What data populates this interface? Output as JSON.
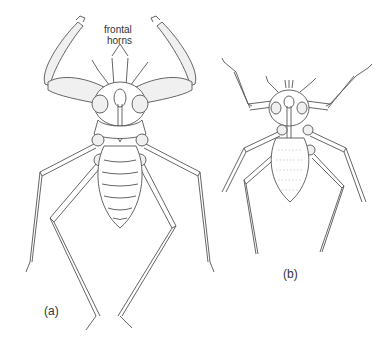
{
  "figure": {
    "annotations": {
      "frontal_horns_line1": "frontal",
      "frontal_horns_line2": "horns"
    },
    "panels": [
      {
        "id": "a",
        "label": "(a)"
      },
      {
        "id": "b",
        "label": "(b)"
      }
    ]
  }
}
